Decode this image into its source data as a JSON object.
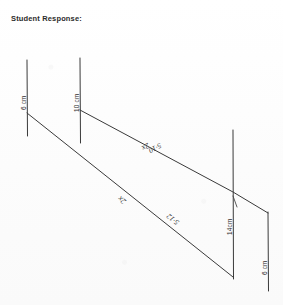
{
  "header": {
    "label": "Student Response:"
  },
  "figure": {
    "type": "hand-drawn-geometry-diagram",
    "vertical_segments": [
      {
        "id": "left-post",
        "label": "6 cm",
        "x": 27,
        "y_top": 60,
        "y_bottom": 136
      },
      {
        "id": "second-post",
        "label": "10 cm",
        "x": 80,
        "y_top": 58,
        "y_bottom": 143
      },
      {
        "id": "third-post",
        "label": "14cm",
        "x": 233,
        "y_top": 130,
        "y_bottom": 279
      },
      {
        "id": "right-post",
        "label": "6 cm",
        "x": 268,
        "y_top": 212,
        "y_bottom": 291
      }
    ],
    "diagonals": [
      {
        "id": "upper-diagonal",
        "from_x": 80,
        "from_y": 110,
        "to_x": 268,
        "to_y": 213,
        "bend_x": 233,
        "bend_y": 192,
        "labels": [
          "2x",
          "5·10"
        ]
      },
      {
        "id": "lower-diagonal",
        "from_x": 27,
        "from_y": 113,
        "to_x": 233,
        "to_y": 277,
        "labels": [
          "2x",
          "5·12"
        ]
      }
    ],
    "annotations": [
      {
        "id": "upper-coefficient",
        "text": "2x"
      },
      {
        "id": "upper-expression",
        "text": "5·10"
      },
      {
        "id": "lower-coefficient",
        "text": "2x"
      },
      {
        "id": "lower-expression",
        "text": "5·12"
      }
    ]
  },
  "colors": {
    "ink": "#3a3a3a",
    "paper": "#fdfdfd",
    "text": "#2b2b2b"
  }
}
